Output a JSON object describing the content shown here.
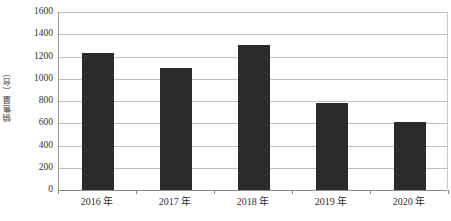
{
  "chart_data": {
    "type": "bar",
    "title": "",
    "subtitle": "",
    "xlabel": "",
    "ylabel": "销售量（台）",
    "categories": [
      "2016 年",
      "2017 年",
      "2018 年",
      "2019 年",
      "2020 年"
    ],
    "values": [
      1230,
      1100,
      1300,
      780,
      610
    ],
    "series": [
      {
        "name": "销售量",
        "values": [
          1230,
          1100,
          1300,
          780,
          610
        ]
      }
    ],
    "ylim": [
      0,
      1600
    ],
    "ytick_step": 200,
    "ytick_labels": [
      "0",
      "200",
      "400",
      "600",
      "800",
      "1000",
      "1200",
      "1400",
      "1600"
    ],
    "ytick_values": [
      0,
      200,
      400,
      600,
      800,
      1000,
      1200,
      1400,
      1600
    ],
    "grid": true,
    "grid_axis": "y",
    "legend": false,
    "legend_position": "none",
    "annotations": [],
    "colors": {
      "bar": "#2b2b2b",
      "gridline": "#bdbdbd",
      "axis": "#8a8a8a",
      "text": "#2f2f2f",
      "background": "#ffffff"
    }
  }
}
